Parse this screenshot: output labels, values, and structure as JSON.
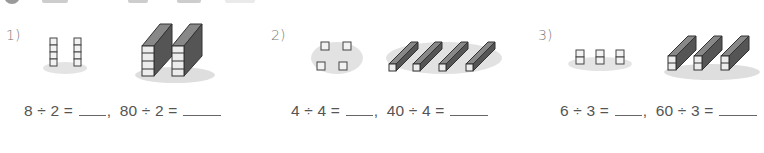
{
  "worksheet": {
    "problems": [
      {
        "number": "1)",
        "small_model": "2 groups of 4 unit cubes",
        "large_model": "2 groups of 4 ten-rods",
        "eq1": {
          "lhs": "8 ÷ 2 =",
          "answer": ""
        },
        "separator": ",",
        "eq2": {
          "lhs": "80 ÷ 2 =",
          "answer": ""
        }
      },
      {
        "number": "2)",
        "small_model": "4 groups of 1 unit cube",
        "large_model": "4 ten-rods",
        "eq1": {
          "lhs": "4 ÷ 4 =",
          "answer": ""
        },
        "separator": ",",
        "eq2": {
          "lhs": "40 ÷ 4 =",
          "answer": ""
        }
      },
      {
        "number": "3)",
        "small_model": "3 groups of 2 unit cubes",
        "large_model": "3 groups of 2 ten-rods",
        "eq1": {
          "lhs": "6 ÷ 3 =",
          "answer": ""
        },
        "separator": ",",
        "eq2": {
          "lhs": "60 ÷ 3 =",
          "answer": ""
        }
      }
    ]
  },
  "colors": {
    "text": "#555555",
    "block_face": "#f4f4f4",
    "block_edge": "#444444",
    "shadow": "#cfcfcf"
  }
}
